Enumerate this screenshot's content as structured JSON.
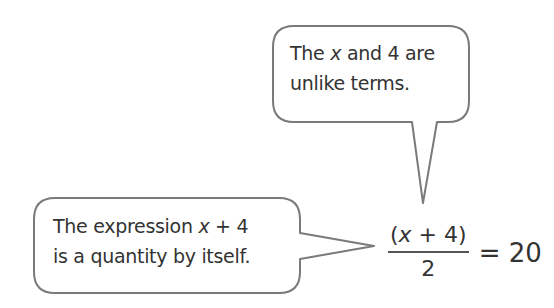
{
  "bubbles": {
    "top": {
      "line1_pre": "The ",
      "line1_var": "x",
      "line1_post": " and 4 are",
      "line2": "unlike terms."
    },
    "bottom": {
      "line1_pre": "The expression ",
      "line1_var": "x",
      "line1_post": " + 4",
      "line2": "is a quantity by itself."
    }
  },
  "equation": {
    "numerator_open": "(",
    "numerator_var": "x",
    "numerator_rest": " + 4)",
    "denominator": "2",
    "rhs": "= 20"
  },
  "colors": {
    "border": "#7a7a7a",
    "text": "#333333"
  }
}
